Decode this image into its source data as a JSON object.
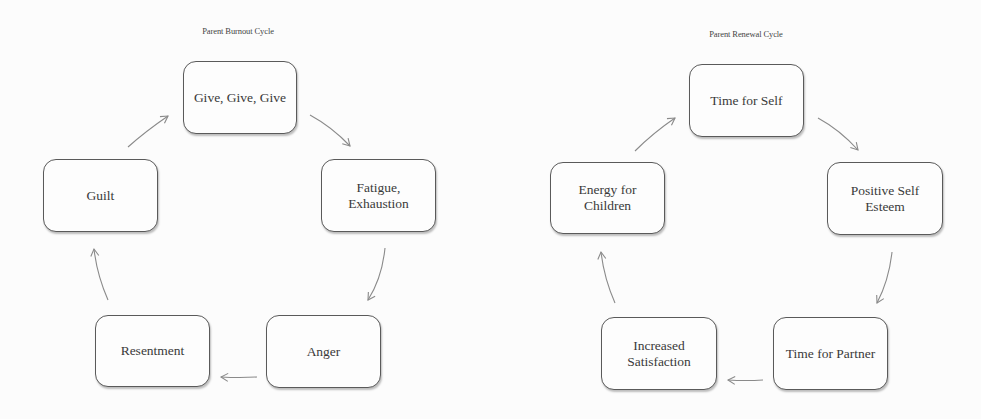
{
  "diagrams": [
    {
      "title": "Parent Burnout Cycle",
      "nodes": [
        {
          "label": "Give, Give, Give"
        },
        {
          "label": "Fatigue, Exhaustion"
        },
        {
          "label": "Anger"
        },
        {
          "label": "Resentment"
        },
        {
          "label": "Guilt"
        }
      ],
      "edges": [
        {
          "from": "Give, Give, Give",
          "to": "Fatigue, Exhaustion"
        },
        {
          "from": "Fatigue, Exhaustion",
          "to": "Anger"
        },
        {
          "from": "Anger",
          "to": "Resentment"
        },
        {
          "from": "Resentment",
          "to": "Guilt"
        },
        {
          "from": "Guilt",
          "to": "Give, Give, Give"
        }
      ]
    },
    {
      "title": "Parent Renewal Cycle",
      "nodes": [
        {
          "label": "Time for Self"
        },
        {
          "label": "Positive Self Esteem"
        },
        {
          "label": "Time for Partner"
        },
        {
          "label": "Increased Satisfaction"
        },
        {
          "label": "Energy for Children"
        }
      ],
      "edges": [
        {
          "from": "Time for Self",
          "to": "Positive Self Esteem"
        },
        {
          "from": "Positive Self Esteem",
          "to": "Time for Partner"
        },
        {
          "from": "Time for Partner",
          "to": "Increased Satisfaction"
        },
        {
          "from": "Increased Satisfaction",
          "to": "Energy for Children"
        },
        {
          "from": "Energy for Children",
          "to": "Time for Self"
        }
      ]
    }
  ],
  "colors": {
    "background": "#fcfcfc",
    "box_border": "#5a5a5a",
    "arrow": "#8a8a8a",
    "text": "#3a3a3a"
  }
}
